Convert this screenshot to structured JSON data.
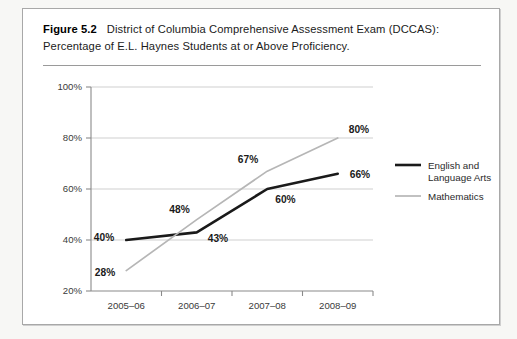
{
  "figure": {
    "label": "Figure 5.2",
    "caption": "District of Columbia Comprehensive Assessment Exam (DCCAS): Percentage of E.L. Haynes Students at or Above Proficiency."
  },
  "colors": {
    "series_ela": "#1a1a1a",
    "series_math": "#b6b6b6",
    "grid": "#c9c9c9",
    "axis": "#8a8a8a",
    "frame": "#a8a8a8",
    "page_background": "#f7f7f5",
    "figure_background": "#ffffff"
  },
  "chart_data": {
    "type": "line",
    "title": "District of Columbia Comprehensive Assessment Exam (DCCAS): Percentage of E.L. Haynes Students at or Above Proficiency.",
    "xlabel": "",
    "ylabel": "",
    "categories": [
      "2005–06",
      "2006–07",
      "2007–08",
      "2008–09"
    ],
    "ylim": [
      20,
      100
    ],
    "yticks": [
      20,
      40,
      60,
      80,
      100
    ],
    "ytick_labels": [
      "20%",
      "40%",
      "60%",
      "80%",
      "100%"
    ],
    "grid": "horizontal",
    "legend_position": "right",
    "series": [
      {
        "name": "English and Language Arts",
        "values": [
          40,
          43,
          60,
          66
        ],
        "labels": [
          "40%",
          "43%",
          "60%",
          "66%"
        ],
        "color": "#1a1a1a",
        "width": 2.6
      },
      {
        "name": "Mathematics",
        "values": [
          28,
          48,
          67,
          80
        ],
        "labels": [
          "28%",
          "48%",
          "67%",
          "80%"
        ],
        "color": "#b6b6b6",
        "width": 1.7
      }
    ]
  },
  "legend": {
    "entries": [
      {
        "label_line1": "English and",
        "label_line2": "Language Arts"
      },
      {
        "label_line1": "Mathematics",
        "label_line2": ""
      }
    ]
  }
}
